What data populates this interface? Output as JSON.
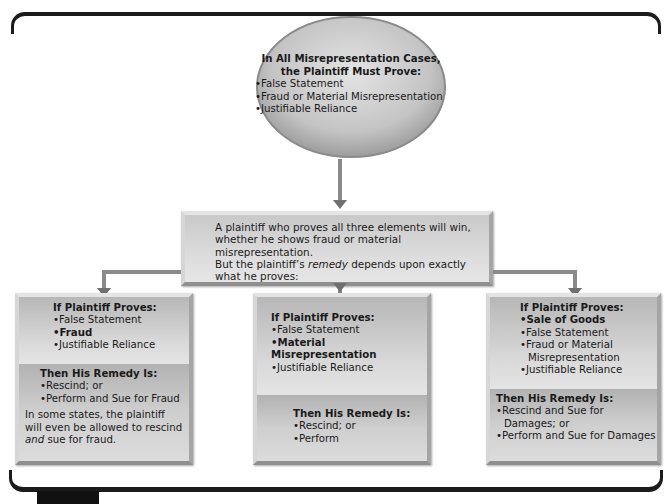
{
  "top": {
    "title_line1": "In All Misrepresentation Cases,",
    "title_line2": "the Plaintiff Must Prove:",
    "items": [
      "False Statement",
      "Fraud or Material Misrepresentation",
      "Justifiable Reliance"
    ]
  },
  "middle": {
    "line1": "A plaintiff who proves all three elements will win,",
    "line2": "whether he shows fraud or material misrepresentation.",
    "line3_pre": "But the plaintiff’s ",
    "line3_em": "remedy",
    "line3_post": " depends upon exactly",
    "line4": "what he proves:"
  },
  "boxes": [
    {
      "proves_heading": "If Plaintiff Proves:",
      "proves": [
        "False Statement",
        "Fraud",
        "Justifiable Reliance"
      ],
      "remedy_heading": "Then His Remedy Is:",
      "remedies": [
        "Rescind; or",
        "Perform and Sue for Fraud"
      ],
      "note_line1": "In some states, the plaintiff",
      "note_line2": "will even be allowed to rescind",
      "note_em": "and",
      "note_post": " sue for fraud."
    },
    {
      "proves_heading": "If Plaintiff Proves:",
      "proves": [
        "False Statement",
        "Material Misrepresentation",
        "Justifiable Reliance"
      ],
      "remedy_heading": "Then His Remedy Is:",
      "remedies": [
        "Rescind; or",
        "Perform"
      ]
    },
    {
      "proves_heading": "If Plaintiff Proves:",
      "proves": [
        "Sale of Goods",
        "False Statement",
        "Fraud or Material",
        "Misrepresentation",
        "Justifiable Reliance"
      ],
      "remedy_heading": "Then His Remedy Is:",
      "remedies": [
        "Rescind and Sue for",
        "Damages; or",
        "Perform and Sue for Damages"
      ]
    }
  ],
  "colors": {
    "frame": "#1b1b1b",
    "panel": "#d3d3d3",
    "connector": "#8a8a8a",
    "arrow": "#707070"
  }
}
